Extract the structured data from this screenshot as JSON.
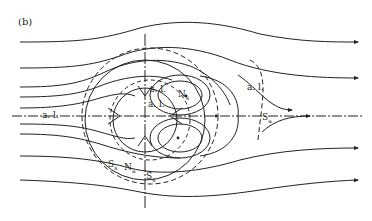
{
  "panel_label": "(b)",
  "labels": {
    "al_left": "a. l.",
    "al_right": "a. l.",
    "al_center": "a. l.",
    "sl": "s. l.",
    "ns_main": "N",
    "ns_sub": "s",
    "sa_main": "S",
    "sa_sub": "a",
    "ss1_main": "S",
    "ss1_sub": "s",
    "na_main": "N",
    "na_sub": "a",
    "ss2_main": "S",
    "ss2_sub": "s"
  },
  "colors": {
    "stroke": "#222222",
    "background": "#ffffff"
  }
}
